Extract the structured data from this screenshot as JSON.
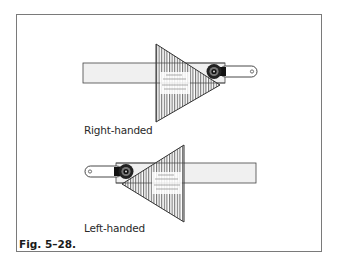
{
  "figure": {
    "caption": "Fig. 5–28.",
    "colors": {
      "frame": "#7a7a7a",
      "outline": "#3a3a3a",
      "blade_fill": "#f0f0f0",
      "hatch": "#555555",
      "knob": "#1a1a1a"
    }
  },
  "diagrams": [
    {
      "id": "right-handed",
      "label": "Right-handed"
    },
    {
      "id": "left-handed",
      "label": "Left-handed"
    }
  ]
}
